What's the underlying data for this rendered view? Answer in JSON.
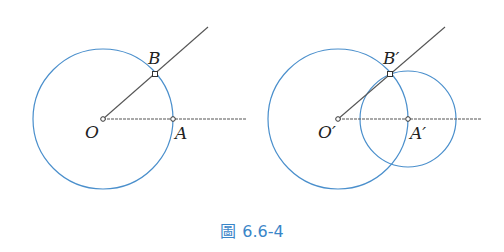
{
  "figure": {
    "caption_prefix": "圖",
    "caption_number": "6.6-4",
    "colors": {
      "circle": "#4a8fcc",
      "line": "#555555",
      "caption": "#3a86c8"
    }
  },
  "left_panel": {
    "labels": {
      "O": "O",
      "A": "A",
      "B": "B"
    },
    "points": {
      "O": [
        103,
        119
      ],
      "A": [
        173,
        119
      ],
      "B": [
        155,
        74
      ]
    },
    "circle": {
      "center": "O",
      "radius": 70
    }
  },
  "right_panel": {
    "labels": {
      "O": "O′",
      "A": "A′",
      "B": "B′"
    },
    "points": {
      "O": [
        338,
        119
      ],
      "A": [
        408,
        119
      ],
      "B": [
        390,
        74
      ]
    },
    "circles": [
      {
        "center": "O′",
        "radius": 70
      },
      {
        "center": "A′",
        "radius": 48
      }
    ]
  }
}
